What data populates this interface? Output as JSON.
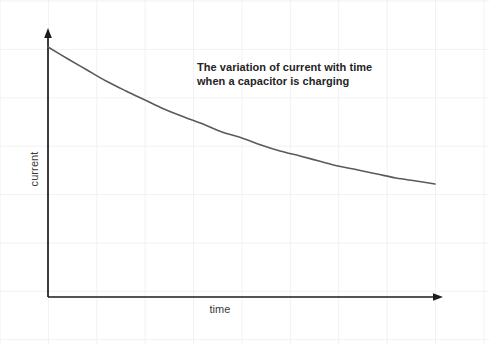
{
  "figure": {
    "width": 489,
    "height": 344,
    "background_color": "#ffffff",
    "grid_color": "#f1f1f1",
    "grid_spacing_px": 48.4
  },
  "title": {
    "line1": "The variation of current with time",
    "line2": "when a capacitor is charging",
    "color": "#242424",
    "bold": true
  },
  "axes": {
    "x_label": "time",
    "y_label": "current",
    "label_color": "#3a3a3a",
    "axis_color": "#1b1b1b",
    "origin_px": {
      "x": 48,
      "y": 297
    },
    "x_axis_end_px": {
      "x": 443,
      "y": 297
    },
    "y_axis_end_px": {
      "x": 48,
      "y": 29
    },
    "arrowheads": [
      "x-axis-end",
      "y-axis-end"
    ]
  },
  "chart_data": {
    "type": "line",
    "title": "The variation of current with time when a capacitor is charging",
    "xlabel": "time",
    "ylabel": "current",
    "grid": true,
    "legend": false,
    "axis_ticks": false,
    "xlim": [
      0,
      1
    ],
    "ylim": [
      0,
      1
    ],
    "curve_color": "#5a5a5a",
    "curve_width_px": 1.6,
    "equation": "I = I0 * exp(-t / RC)",
    "series": [
      {
        "name": "current",
        "x": [
          0.0,
          0.05,
          0.1,
          0.15,
          0.2,
          0.25,
          0.3,
          0.35,
          0.4,
          0.45,
          0.5,
          0.55,
          0.6,
          0.65,
          0.7,
          0.75,
          0.8,
          0.85,
          0.9,
          0.95,
          1.0
        ],
        "y": [
          1.0,
          0.93,
          0.865,
          0.805,
          0.749,
          0.697,
          0.648,
          0.603,
          0.561,
          0.522,
          0.486,
          0.452,
          0.42,
          0.391,
          0.364,
          0.338,
          0.315,
          0.293,
          0.272,
          0.253,
          0.236
        ]
      }
    ],
    "pixel_points": [
      {
        "x": 48,
        "y": 47
      },
      {
        "x": 68,
        "y": 59
      },
      {
        "x": 87,
        "y": 70
      },
      {
        "x": 106,
        "y": 81
      },
      {
        "x": 126,
        "y": 91
      },
      {
        "x": 145,
        "y": 100
      },
      {
        "x": 164,
        "y": 109
      },
      {
        "x": 184,
        "y": 117
      },
      {
        "x": 203,
        "y": 124
      },
      {
        "x": 222,
        "y": 132
      },
      {
        "x": 242,
        "y": 138
      },
      {
        "x": 261,
        "y": 145
      },
      {
        "x": 280,
        "y": 151
      },
      {
        "x": 300,
        "y": 156
      },
      {
        "x": 319,
        "y": 161
      },
      {
        "x": 338,
        "y": 166
      },
      {
        "x": 358,
        "y": 170
      },
      {
        "x": 377,
        "y": 174
      },
      {
        "x": 396,
        "y": 178
      },
      {
        "x": 416,
        "y": 181
      },
      {
        "x": 435,
        "y": 184
      }
    ]
  }
}
